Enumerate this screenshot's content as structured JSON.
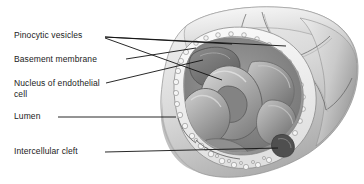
{
  "figure": {
    "style": "grayscale anatomical drawing",
    "background_color": "#ffffff",
    "line_color": "#111111",
    "text_color": "#1b1b1b",
    "palette": {
      "outer_wall_light": "#e9e9e9",
      "outer_wall_mid": "#cfcfcf",
      "outer_wall_shadow": "#9d9d9d",
      "endothelium": "#b9b9b9",
      "endothelium_dark": "#8a8a8a",
      "basement_membrane": "#f2f2f2",
      "lumen_dark": "#6f6f6f",
      "rbc_light": "#c6c6c6",
      "rbc_mid": "#a5a5a5",
      "rbc_dark": "#7a7a7a",
      "nucleus": "#7c7c7c",
      "cleft": "#4a4a4a"
    }
  },
  "labels": [
    {
      "id": "pinocytic-vesicles",
      "text": "Pinocytic vesicles",
      "x": 14,
      "y": 34,
      "leader_count": 3
    },
    {
      "id": "basement-membrane",
      "text": "Basement membrane",
      "x": 14,
      "y": 56,
      "leader_count": 1
    },
    {
      "id": "nucleus-of-endothelial-cell",
      "text": "Nucleus of endothelial",
      "text_line2": "cell",
      "x": 14,
      "y": 80,
      "leader_count": 1
    },
    {
      "id": "lumen",
      "text": "Lumen",
      "x": 14,
      "y": 113,
      "leader_count": 1
    },
    {
      "id": "intercellular-cleft",
      "text": "Intercellular cleft",
      "x": 14,
      "y": 148,
      "leader_count": 1
    }
  ]
}
